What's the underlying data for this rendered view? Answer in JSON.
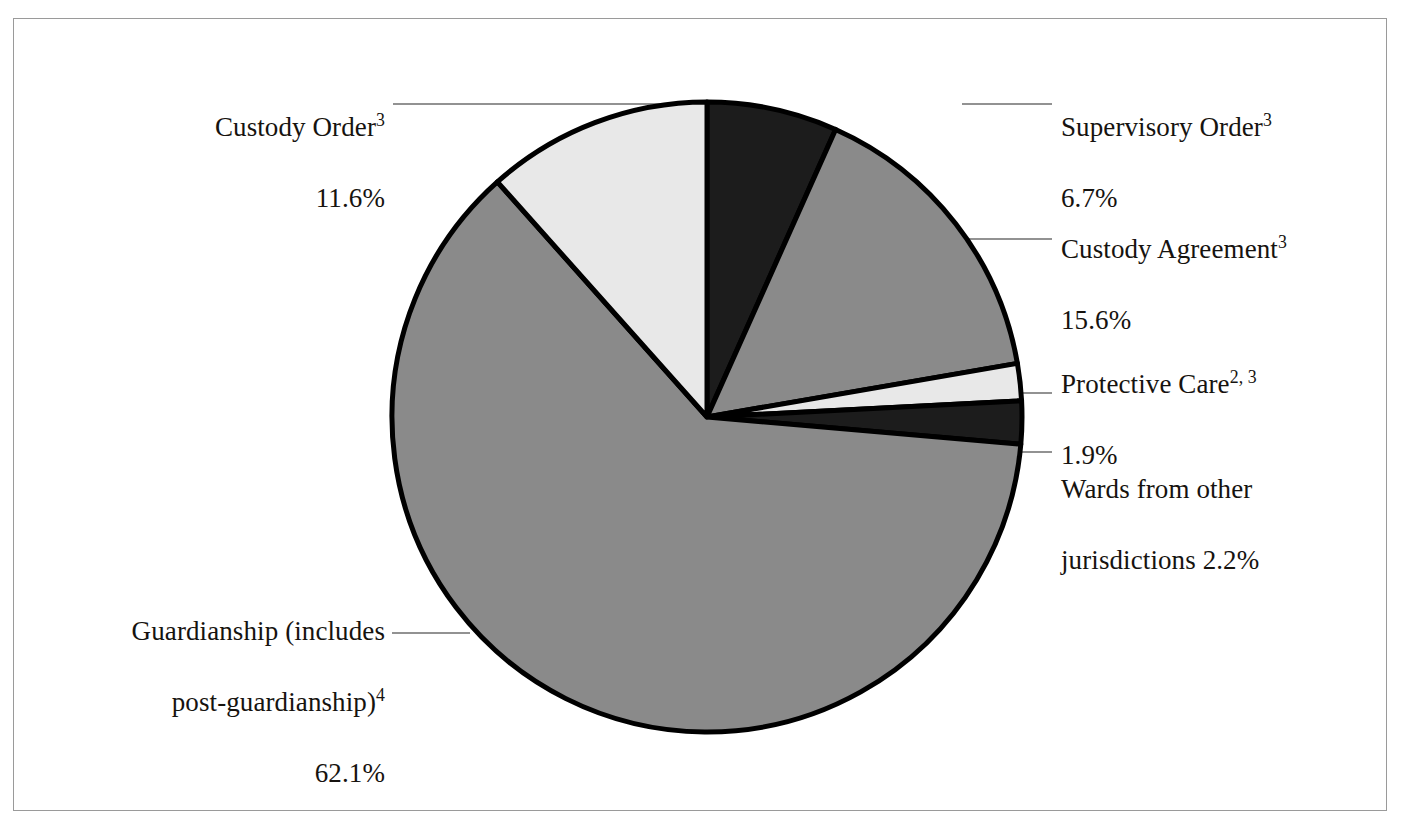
{
  "figure": {
    "background_color": "#ffffff",
    "frame_color": "#9a9a9a"
  },
  "chart_data": {
    "type": "pie",
    "title": "",
    "subtitle": "",
    "xlabel": "",
    "ylabel": "",
    "legend_position": "callout-labels",
    "grid": false,
    "start_angle_deg": 0,
    "direction": "clockwise",
    "units": "percent",
    "categories": [
      "Supervisory Order",
      "Custody Agreement",
      "Protective Care",
      "Wards from other jurisdictions",
      "Guardianship (includes post-guardianship)",
      "Custody Order"
    ],
    "values": [
      6.7,
      15.6,
      1.9,
      2.2,
      62.1,
      11.6
    ],
    "slices": [
      {
        "name": "supervisory-order",
        "label": "Supervisory Order",
        "footnote": "3",
        "value": 6.7,
        "value_text": "6.7%",
        "color": "#1c1c1c"
      },
      {
        "name": "custody-agreement",
        "label": "Custody Agreement",
        "footnote": "3",
        "value": 15.6,
        "value_text": "15.6%",
        "color": "#8a8a8a"
      },
      {
        "name": "protective-care",
        "label": "Protective Care",
        "footnote": "2, 3",
        "value": 1.9,
        "value_text": "1.9%",
        "color": "#e8e8e8"
      },
      {
        "name": "wards-other-jurisdictions",
        "label": "Wards from other jurisdictions",
        "footnote": "",
        "value": 2.2,
        "value_text": "2.2%",
        "color": "#1c1c1c"
      },
      {
        "name": "guardianship",
        "label": "Guardianship (includes post-guardianship)",
        "footnote": "4",
        "value": 62.1,
        "value_text": "62.1%",
        "color": "#8a8a8a"
      },
      {
        "name": "custody-order",
        "label": "Custody Order",
        "footnote": "3",
        "value": 11.6,
        "value_text": "11.6%",
        "color": "#e8e8e8"
      }
    ]
  },
  "callouts": {
    "custody_order": {
      "line1": "Custody Order",
      "sup1": "3",
      "line2": "11.6%"
    },
    "guardianship": {
      "line1": "Guardianship (includes",
      "line2": "post-guardianship)",
      "sup2": "4",
      "line3": "62.1%"
    },
    "supervisory_order": {
      "line1": "Supervisory Order",
      "sup1": "3",
      "line2": "6.7%"
    },
    "custody_agreement": {
      "line1": "Custody Agreement",
      "sup1": "3",
      "line2": "15.6%"
    },
    "protective_care": {
      "line1": "Protective Care",
      "sup1": "2, 3",
      "line2": "1.9%"
    },
    "wards": {
      "line1": "Wards from other",
      "line2": "jurisdictions 2.2%"
    }
  }
}
